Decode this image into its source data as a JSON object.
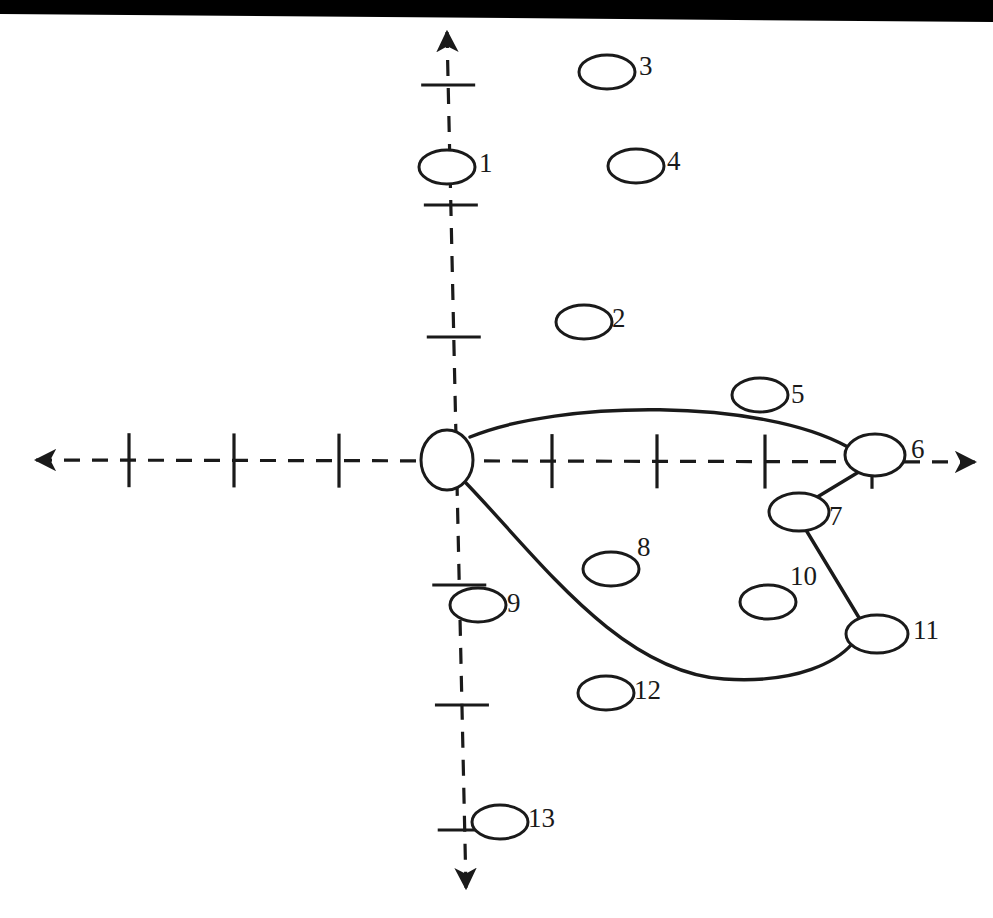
{
  "figure": {
    "type": "node-coordinate-diagram",
    "background_color": "#ffffff",
    "stroke_color": "#1a1a1a",
    "scan_artifact_color": "#000000",
    "width": 993,
    "height": 918
  },
  "axes": {
    "origin": {
      "x": 447,
      "y": 460
    },
    "x_axis": {
      "style": "dashed",
      "arrow_start": {
        "x": 36,
        "y": 460
      },
      "arrow_end": {
        "x": 975,
        "y": 462
      },
      "ticks_negative": [
        129,
        234,
        339
      ],
      "ticks_positive": [
        552,
        657,
        765,
        872
      ],
      "tick_half_length": 27
    },
    "y_axis": {
      "style": "dashed",
      "arrow_start": {
        "x": 447,
        "y": 32
      },
      "arrow_end": {
        "x": 466,
        "y": 888
      },
      "ticks_positive": [
        85,
        205,
        337
      ],
      "ticks_negative": [
        585,
        705,
        830
      ],
      "tick_half_length": 27
    }
  },
  "nodes": [
    {
      "id": "origin",
      "label": "",
      "cx": 447,
      "cy": 460,
      "rx": 26,
      "ry": 30,
      "label_dx": 0,
      "label_dy": 0,
      "on_axis": "origin"
    },
    {
      "id": "n1",
      "label": "1",
      "cx": 447,
      "cy": 167,
      "rx": 28,
      "ry": 17,
      "label_dx": 32,
      "label_dy": -13,
      "on_axis": "y-positive"
    },
    {
      "id": "n2",
      "label": "2",
      "cx": 584,
      "cy": 322,
      "rx": 28,
      "ry": 17,
      "label_dx": 28,
      "label_dy": -13,
      "on_axis": "none"
    },
    {
      "id": "n3",
      "label": "3",
      "cx": 607,
      "cy": 72,
      "rx": 28,
      "ry": 17,
      "label_dx": 32,
      "label_dy": -15,
      "on_axis": "none"
    },
    {
      "id": "n4",
      "label": "4",
      "cx": 636,
      "cy": 166,
      "rx": 28,
      "ry": 17,
      "label_dx": 31,
      "label_dy": -14,
      "on_axis": "none"
    },
    {
      "id": "n5",
      "label": "5",
      "cx": 760,
      "cy": 395,
      "rx": 28,
      "ry": 17,
      "label_dx": 31,
      "label_dy": -10,
      "on_axis": "none"
    },
    {
      "id": "n6",
      "label": "6",
      "cx": 875,
      "cy": 455,
      "rx": 30,
      "ry": 21,
      "label_dx": 34,
      "label_dy": -15,
      "on_axis": "x-positive"
    },
    {
      "id": "n7",
      "label": "7",
      "cx": 799,
      "cy": 512,
      "rx": 30,
      "ry": 19,
      "label_dx": 28,
      "label_dy": -5,
      "on_axis": "none"
    },
    {
      "id": "n8",
      "label": "8",
      "cx": 611,
      "cy": 569,
      "rx": 28,
      "ry": 17,
      "label_dx": 26,
      "label_dy": -31,
      "on_axis": "none"
    },
    {
      "id": "n9",
      "label": "9",
      "cx": 478,
      "cy": 605,
      "rx": 28,
      "ry": 17,
      "label_dx": 29,
      "label_dy": -11,
      "on_axis": "y-negative"
    },
    {
      "id": "n10",
      "label": "10",
      "cx": 768,
      "cy": 602,
      "rx": 28,
      "ry": 17,
      "label_dx": 22,
      "label_dy": -35,
      "on_axis": "none"
    },
    {
      "id": "n11",
      "label": "11",
      "cx": 877,
      "cy": 634,
      "rx": 31,
      "ry": 19,
      "label_dx": 33,
      "label_dy": -13,
      "on_axis": "none"
    },
    {
      "id": "n12",
      "label": "12",
      "cx": 606,
      "cy": 693,
      "rx": 28,
      "ry": 17,
      "label_dx": 28,
      "label_dy": -12,
      "on_axis": "none"
    },
    {
      "id": "n13",
      "label": "13",
      "cx": 500,
      "cy": 822,
      "rx": 28,
      "ry": 17,
      "label_dx": 28,
      "label_dy": -13,
      "on_axis": "y-negative"
    }
  ],
  "edges": [
    {
      "id": "e-origin-n6",
      "from": "origin",
      "to": "n6",
      "style": "curve-up",
      "path": "M 470 437 C 560 400, 760 398, 848 447"
    },
    {
      "id": "e-n6-n7",
      "from": "n6",
      "to": "n7",
      "style": "straight",
      "path": "M 862 470 L 814 499"
    },
    {
      "id": "e-n7-n11",
      "from": "n7",
      "to": "n11",
      "style": "straight",
      "path": "M 806 530 L 861 621"
    },
    {
      "id": "e-origin-n11",
      "from": "origin",
      "to": "n11",
      "style": "curve-down",
      "path": "M 466 483 C 540 560, 620 672, 724 679 C 800 684, 838 660, 852 644"
    }
  ],
  "labels": {
    "caption": ""
  }
}
